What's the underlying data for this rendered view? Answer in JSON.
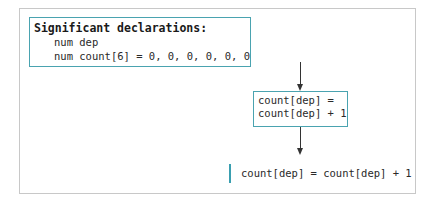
{
  "declarations": {
    "title": "Significant declarations:",
    "lines": [
      "num dep",
      "num count[6] = 0, 0, 0, 0, 0, 0"
    ]
  },
  "process_box": {
    "lines": [
      "count[dep] =",
      "count[dep] + 1"
    ]
  },
  "pseudocode": {
    "line": "count[dep] = count[dep] + 1"
  },
  "colors": {
    "box_border": "#4aa3b0",
    "frame_border": "#c8c8c8",
    "arrow": "#333333",
    "code_bar": "#3a9fb0"
  }
}
